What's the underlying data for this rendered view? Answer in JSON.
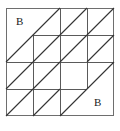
{
  "figure": {
    "background_color": "#ffffff",
    "stroke_color": "#4d4d4d",
    "diagonal_color": "#333333",
    "border_color": "#666666",
    "stroke_width": 1,
    "outer_border": {
      "x": 6,
      "y": 8,
      "width": 108,
      "height": 108
    },
    "grid": {
      "columns": 4,
      "rows": 4,
      "x_positions": [
        6,
        33,
        60,
        87,
        114
      ],
      "y_positions": [
        8,
        35,
        62,
        89,
        116
      ],
      "cell_size": 27
    },
    "labels": [
      {
        "id": "b-top-left",
        "text": "B",
        "x": 16,
        "y": 16,
        "region": "upper-left-large-triangle"
      },
      {
        "id": "b-bottom-right",
        "text": "B",
        "x": 94,
        "y": 97,
        "region": "lower-right-large-triangle"
      }
    ],
    "vertical_segments": [
      {
        "x": 33,
        "y1": 35,
        "y2": 116
      },
      {
        "x": 60,
        "y1": 8,
        "y2": 116
      },
      {
        "x": 87,
        "y1": 8,
        "y2": 89
      }
    ],
    "horizontal_segments": [
      {
        "y": 35,
        "x1": 33,
        "x2": 114
      },
      {
        "y": 62,
        "x1": 6,
        "x2": 114
      },
      {
        "y": 89,
        "x1": 6,
        "x2": 87
      }
    ],
    "diagonals": [
      {
        "x1": 6,
        "y1": 62,
        "x2": 60,
        "y2": 8
      },
      {
        "x1": 60,
        "y1": 35,
        "x2": 87,
        "y2": 8
      },
      {
        "x1": 87,
        "y1": 35,
        "x2": 114,
        "y2": 8
      },
      {
        "x1": 33,
        "y1": 62,
        "x2": 60,
        "y2": 35
      },
      {
        "x1": 60,
        "y1": 62,
        "x2": 87,
        "y2": 35
      },
      {
        "x1": 87,
        "y1": 62,
        "x2": 114,
        "y2": 35
      },
      {
        "x1": 6,
        "y1": 89,
        "x2": 33,
        "y2": 62
      },
      {
        "x1": 33,
        "y1": 89,
        "x2": 60,
        "y2": 62
      },
      {
        "x1": 60,
        "y1": 116,
        "x2": 114,
        "y2": 62
      },
      {
        "x1": 6,
        "y1": 116,
        "x2": 33,
        "y2": 89
      },
      {
        "x1": 33,
        "y1": 116,
        "x2": 60,
        "y2": 89
      }
    ]
  }
}
